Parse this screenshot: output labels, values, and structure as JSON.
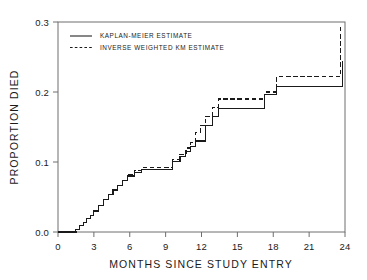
{
  "chart_data": {
    "type": "line",
    "subtype": "step-function survival curve",
    "title": "",
    "xlabel": "MONTHS SINCE STUDY ENTRY",
    "ylabel": "PROPORTION DIED",
    "xlim": [
      0,
      24
    ],
    "ylim": [
      0.0,
      0.3
    ],
    "xticks": [
      0,
      3,
      6,
      9,
      12,
      15,
      18,
      21,
      24
    ],
    "xticklabels": [
      "0",
      "3",
      "6",
      "9",
      "12",
      "15",
      "18",
      "21",
      "24"
    ],
    "yticks": [
      0.0,
      0.1,
      0.2,
      0.3
    ],
    "yticklabels": [
      "0.0",
      "0.1",
      "0.2",
      "0.3"
    ],
    "grid": false,
    "legend_position": "top-left-inside",
    "series": [
      {
        "name": "KAPLAN-MEIER ESTIMATE",
        "style": "solid",
        "color": "#1a1a1a",
        "x": [
          0.0,
          1.2,
          1.5,
          1.8,
          2.1,
          2.4,
          2.7,
          3.0,
          3.4,
          3.8,
          4.2,
          4.6,
          5.0,
          5.4,
          5.8,
          6.4,
          7.0,
          9.2,
          9.6,
          10.2,
          10.7,
          11.1,
          11.5,
          11.9,
          12.3,
          12.9,
          13.4,
          17.0,
          17.3,
          18.3,
          21.1,
          23.8
        ],
        "y": [
          0.0,
          0.0,
          0.004,
          0.009,
          0.014,
          0.019,
          0.024,
          0.03,
          0.038,
          0.046,
          0.053,
          0.06,
          0.067,
          0.074,
          0.08,
          0.085,
          0.089,
          0.089,
          0.101,
          0.108,
          0.115,
          0.122,
          0.13,
          0.13,
          0.152,
          0.165,
          0.176,
          0.176,
          0.196,
          0.208,
          0.208,
          0.245
        ]
      },
      {
        "name": "INVERSE WEIGHTED KM ESTIMATE",
        "style": "dashed",
        "color": "#1a1a1a",
        "x": [
          0.0,
          1.2,
          1.5,
          1.8,
          2.1,
          2.4,
          2.7,
          3.0,
          3.4,
          3.8,
          4.2,
          4.6,
          5.0,
          5.4,
          5.8,
          6.4,
          7.0,
          9.2,
          9.6,
          10.2,
          10.7,
          11.1,
          11.5,
          11.9,
          12.3,
          12.9,
          13.4,
          17.0,
          17.3,
          18.3,
          21.1,
          23.6
        ],
        "y": [
          0.0,
          0.0,
          0.004,
          0.009,
          0.014,
          0.019,
          0.024,
          0.03,
          0.038,
          0.046,
          0.053,
          0.06,
          0.067,
          0.074,
          0.082,
          0.088,
          0.092,
          0.092,
          0.104,
          0.111,
          0.12,
          0.128,
          0.142,
          0.152,
          0.165,
          0.178,
          0.19,
          0.19,
          0.2,
          0.222,
          0.222,
          0.295
        ]
      }
    ],
    "legend": [
      {
        "label": "KAPLAN-MEIER ESTIMATE",
        "style": "solid"
      },
      {
        "label": "INVERSE WEIGHTED KM ESTIMATE",
        "style": "dashed"
      }
    ]
  }
}
